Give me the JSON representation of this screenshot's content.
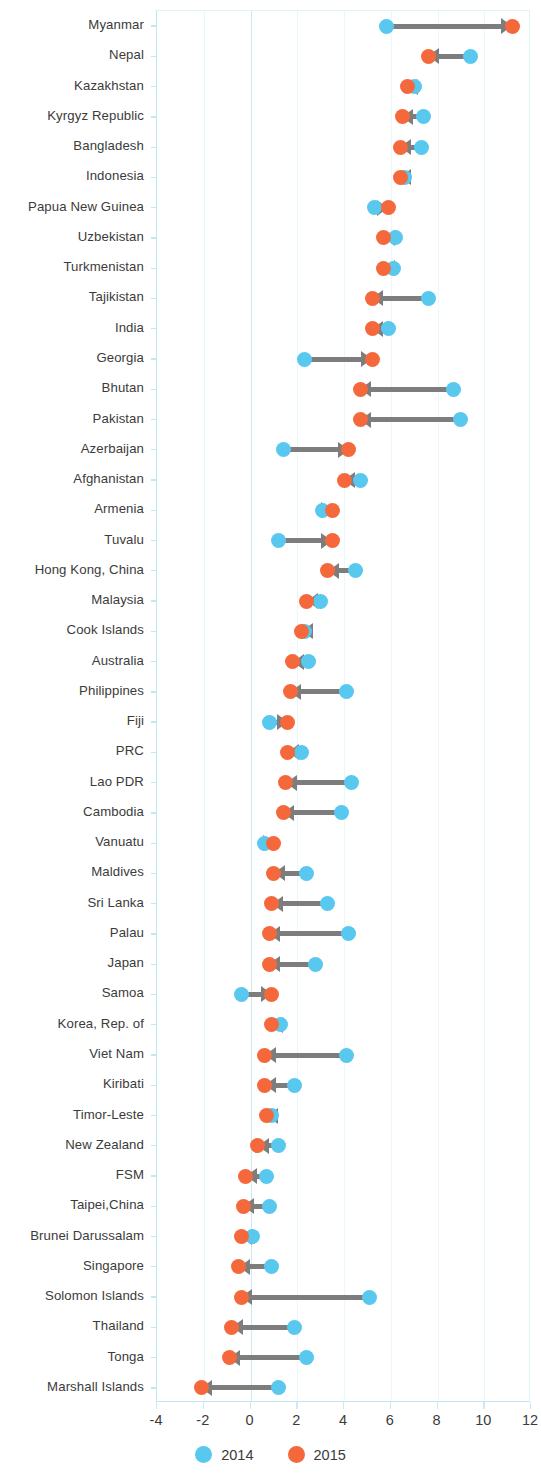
{
  "chart_data": {
    "type": "scatter",
    "subtype": "dumbbell-arrow",
    "title": "",
    "subtitle": "",
    "xlabel": "",
    "ylabel": "",
    "xlim": [
      -4,
      12
    ],
    "xticks": [
      -4,
      -2,
      0,
      2,
      4,
      6,
      8,
      10,
      12
    ],
    "xtick_labels": [
      "-4",
      "-2",
      "0",
      "2",
      "4",
      "6",
      "8",
      "10",
      "12"
    ],
    "grid": true,
    "grid_axis": "x",
    "legend_position": "bottom",
    "colors": {
      "series_2014": "#59c8ef",
      "series_2015": "#f4683c",
      "connector": "#7d7d7d",
      "grid": "#eaf7fb",
      "axis": "#bfe8f2",
      "text": "#3b3b3b"
    },
    "legend": [
      {
        "label": "2014",
        "color": "#59c8ef"
      },
      {
        "label": "2015",
        "color": "#f4683c"
      }
    ],
    "series": [
      {
        "name": "2014",
        "color": "#59c8ef"
      },
      {
        "name": "2015",
        "color": "#f4683c"
      }
    ],
    "categories": [
      "Myanmar",
      "Nepal",
      "Kazakhstan",
      "Kyrgyz Republic",
      "Bangladesh",
      "Indonesia",
      "Papua New Guinea",
      "Uzbekistan",
      "Turkmenistan",
      "Tajikistan",
      "India",
      "Georgia",
      "Bhutan",
      "Pakistan",
      "Azerbaijan",
      "Afghanistan",
      "Armenia",
      "Tuvalu",
      "Hong Kong, China",
      "Malaysia",
      "Cook Islands",
      "Australia",
      "Philippines",
      "Fiji",
      "PRC",
      "Lao PDR",
      "Cambodia",
      "Vanuatu",
      "Maldives",
      "Sri Lanka",
      "Palau",
      "Japan",
      "Samoa",
      "Korea, Rep. of",
      "Viet Nam",
      "Kiribati",
      "Timor-Leste",
      "New Zealand",
      "FSM",
      "Taipei,China",
      "Brunei Darussalam",
      "Singapore",
      "Solomon Islands",
      "Thailand",
      "Tonga",
      "Marshall Islands"
    ],
    "points": [
      {
        "category": "Myanmar",
        "v2014": 5.8,
        "v2015": 11.2
      },
      {
        "category": "Nepal",
        "v2014": 9.4,
        "v2015": 7.6
      },
      {
        "category": "Kazakhstan",
        "v2014": 7.0,
        "v2015": 6.7
      },
      {
        "category": "Kyrgyz Republic",
        "v2014": 7.4,
        "v2015": 6.5
      },
      {
        "category": "Bangladesh",
        "v2014": 7.3,
        "v2015": 6.4
      },
      {
        "category": "Indonesia",
        "v2014": 6.6,
        "v2015": 6.4
      },
      {
        "category": "Papua New Guinea",
        "v2014": 5.3,
        "v2015": 5.9
      },
      {
        "category": "Uzbekistan",
        "v2014": 6.2,
        "v2015": 5.7
      },
      {
        "category": "Turkmenistan",
        "v2014": 6.1,
        "v2015": 5.7
      },
      {
        "category": "Tajikistan",
        "v2014": 7.6,
        "v2015": 5.2
      },
      {
        "category": "India",
        "v2014": 5.9,
        "v2015": 5.2
      },
      {
        "category": "Georgia",
        "v2014": 2.3,
        "v2015": 5.2
      },
      {
        "category": "Bhutan",
        "v2014": 8.7,
        "v2015": 4.7
      },
      {
        "category": "Pakistan",
        "v2014": 9.0,
        "v2015": 4.7
      },
      {
        "category": "Azerbaijan",
        "v2014": 1.4,
        "v2015": 4.2
      },
      {
        "category": "Afghanistan",
        "v2014": 4.7,
        "v2015": 4.0
      },
      {
        "category": "Armenia",
        "v2014": 3.1,
        "v2015": 3.5
      },
      {
        "category": "Tuvalu",
        "v2014": 1.2,
        "v2015": 3.5
      },
      {
        "category": "Hong Kong, China",
        "v2014": 4.5,
        "v2015": 3.3
      },
      {
        "category": "Malaysia",
        "v2014": 3.0,
        "v2015": 2.4
      },
      {
        "category": "Cook Islands",
        "v2014": 2.3,
        "v2015": 2.2
      },
      {
        "category": "Australia",
        "v2014": 2.5,
        "v2015": 1.8
      },
      {
        "category": "Philippines",
        "v2014": 4.1,
        "v2015": 1.7
      },
      {
        "category": "Fiji",
        "v2014": 0.8,
        "v2015": 1.6
      },
      {
        "category": "PRC",
        "v2014": 2.2,
        "v2015": 1.6
      },
      {
        "category": "Lao PDR",
        "v2014": 4.3,
        "v2015": 1.5
      },
      {
        "category": "Cambodia",
        "v2014": 3.9,
        "v2015": 1.4
      },
      {
        "category": "Vanuatu",
        "v2014": 0.6,
        "v2015": 1.0
      },
      {
        "category": "Maldives",
        "v2014": 2.4,
        "v2015": 1.0
      },
      {
        "category": "Sri Lanka",
        "v2014": 3.3,
        "v2015": 0.9
      },
      {
        "category": "Palau",
        "v2014": 4.2,
        "v2015": 0.8
      },
      {
        "category": "Japan",
        "v2014": 2.8,
        "v2015": 0.8
      },
      {
        "category": "Samoa",
        "v2014": -0.4,
        "v2015": 0.9
      },
      {
        "category": "Korea, Rep. of",
        "v2014": 1.3,
        "v2015": 0.9
      },
      {
        "category": "Viet Nam",
        "v2014": 4.1,
        "v2015": 0.6
      },
      {
        "category": "Kiribati",
        "v2014": 1.9,
        "v2015": 0.6
      },
      {
        "category": "Timor-Leste",
        "v2014": 0.9,
        "v2015": 0.7
      },
      {
        "category": "New Zealand",
        "v2014": 1.2,
        "v2015": 0.3
      },
      {
        "category": "FSM",
        "v2014": 0.7,
        "v2015": -0.2
      },
      {
        "category": "Taipei,China",
        "v2014": 0.8,
        "v2015": -0.3
      },
      {
        "category": "Brunei Darussalam",
        "v2014": 0.1,
        "v2015": -0.4
      },
      {
        "category": "Singapore",
        "v2014": 0.9,
        "v2015": -0.5
      },
      {
        "category": "Solomon Islands",
        "v2014": 5.1,
        "v2015": -0.4
      },
      {
        "category": "Thailand",
        "v2014": 1.9,
        "v2015": -0.8
      },
      {
        "category": "Tonga",
        "v2014": 2.4,
        "v2015": -0.9
      },
      {
        "category": "Marshall Islands",
        "v2014": 1.2,
        "v2015": -2.1
      }
    ]
  }
}
